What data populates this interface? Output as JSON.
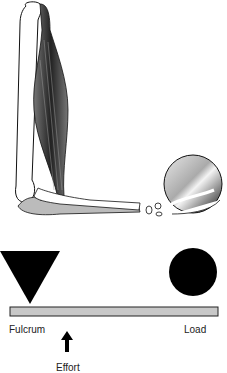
{
  "figure": {
    "type": "lever-diagram",
    "illustration": "forearm-lifting-ball",
    "labels": {
      "fulcrum": "Fulcrum",
      "effort": "Effort",
      "load": "Load"
    },
    "colors": {
      "shape_fill": "#000000",
      "lever_bar": "#c8c8c8",
      "muscle_dark": "#3a3a3a",
      "bone_fill": "#ffffff"
    }
  }
}
